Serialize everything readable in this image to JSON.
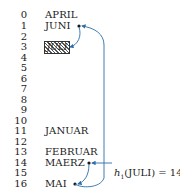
{
  "diagram": {
    "type": "hash-table-chaining",
    "indices": [
      "0",
      "1",
      "2",
      "3",
      "4",
      "5",
      "6",
      "7",
      "8",
      "9",
      "10",
      "11",
      "12",
      "13",
      "14",
      "15",
      "16"
    ],
    "entries": [
      {
        "index": 0,
        "key": "APRIL"
      },
      {
        "index": 1,
        "key": "JUNI"
      },
      {
        "index": 3,
        "key": "JULI",
        "highlighted": true
      },
      {
        "index": 11,
        "key": "JANUAR"
      },
      {
        "index": 13,
        "key": "FEBRUAR"
      },
      {
        "index": 14,
        "key": "MAERZ"
      },
      {
        "index": 16,
        "key": "MAI"
      }
    ],
    "hash_label": {
      "func": "h",
      "subscript": "1",
      "text": "(JULI) = 14"
    },
    "chain": [
      "MAERZ",
      "MAI",
      "JUNI",
      "JULI"
    ],
    "colors": {
      "arrow": "#2b6ea8",
      "text": "#1a1a1a"
    }
  }
}
